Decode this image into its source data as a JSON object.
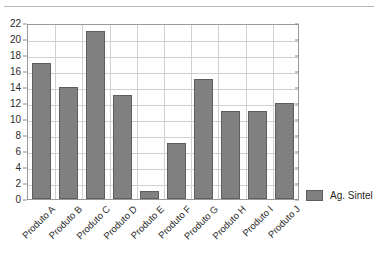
{
  "chart_data": {
    "type": "bar",
    "title": "",
    "xlabel": "",
    "ylabel": "",
    "ylim": [
      0,
      22
    ],
    "ytick_step": 2,
    "yticks": [
      0,
      2,
      4,
      6,
      8,
      10,
      12,
      14,
      16,
      18,
      20,
      22
    ],
    "grid": true,
    "legend_position": "right",
    "categories": [
      "Produto A",
      "Produto B",
      "Produto C",
      "Produto D",
      "Produto E",
      "Produto F",
      "Produto G",
      "Produto H",
      "Produto I",
      "Produto J"
    ],
    "series": [
      {
        "name": "Ag. Sintel",
        "color": "#808080",
        "values": [
          17,
          14,
          21,
          13,
          1,
          7,
          15,
          11,
          11,
          12
        ]
      }
    ]
  },
  "legend": {
    "entries": [
      {
        "label": "Ag. Sintel",
        "color": "#808080"
      }
    ]
  },
  "colors": {
    "bar_fill": "#808080",
    "bar_stroke": "#5e5e5e",
    "grid": "#d0d0d0",
    "axis": "#9a9a9a",
    "text": "#2b2b2b",
    "background": "#ffffff"
  }
}
